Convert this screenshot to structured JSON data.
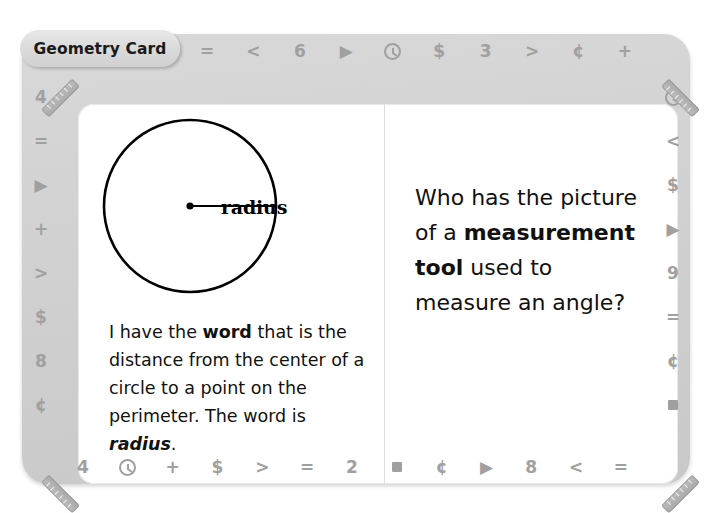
{
  "card": {
    "tab_label": "Geometry Card",
    "frame_color": "#d3d3d3",
    "page_color": "#ffffff",
    "symbol_color": "#a0a0a0"
  },
  "border_symbols": {
    "top": [
      "=",
      "<",
      "6",
      "▶",
      "clock-icon",
      "$",
      "3",
      ">",
      "¢",
      "+"
    ],
    "right": [
      "clock-icon",
      "<",
      "$",
      "▶",
      "9",
      "=",
      "¢",
      "square-icon"
    ],
    "bottom": [
      "4",
      "clock-icon",
      "+",
      "$",
      ">",
      "=",
      "2",
      "square-icon",
      "¢",
      "▶",
      "8",
      "<",
      "="
    ],
    "left": [
      "4",
      "=",
      "▶",
      "+",
      ">",
      "$",
      "8",
      "¢"
    ],
    "corners": [
      "ruler-icon",
      "ruler-icon",
      "ruler-icon",
      "ruler-icon"
    ]
  },
  "left_panel": {
    "figure": {
      "shape": "circle",
      "label": "radius",
      "center_dot": true,
      "radius_line": true
    },
    "answer_text": {
      "part1": "I have the ",
      "bold1": "word",
      "part2": " that is the distance from the center of a circle to a point on the perimeter. The word is ",
      "bold_italic": "radius",
      "part3": "."
    }
  },
  "right_panel": {
    "question_text": {
      "part1": "Who has the picture of a ",
      "bold1": "measurement tool",
      "part2": " used to measure an angle?"
    }
  }
}
